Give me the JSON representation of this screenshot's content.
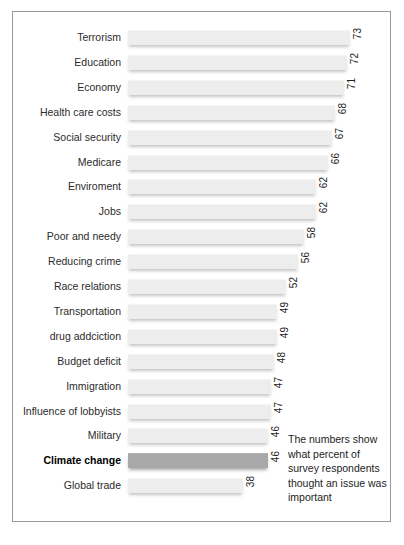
{
  "chart_data": {
    "type": "bar",
    "orientation": "horizontal",
    "title": "",
    "subtitle": "",
    "xlabel": "",
    "ylabel": "",
    "xlim": [
      0,
      80
    ],
    "grid": false,
    "legend": null,
    "annotation": "The numbers show what percent of survey respondents thought an issue was important",
    "highlight_category": "Climate change",
    "categories": [
      "Terrorism",
      "Education",
      "Economy",
      "Health care costs",
      "Social security",
      "Medicare",
      "Enviroment",
      "Jobs",
      "Poor and needy",
      "Reducing crime",
      "Race relations",
      "Transportation",
      "drug addciction",
      "Budget deficit",
      "Immigration",
      "Influence of lobbyists",
      "Military",
      "Climate change",
      "Global trade"
    ],
    "values": [
      73,
      72,
      71,
      68,
      67,
      66,
      62,
      62,
      58,
      56,
      52,
      49,
      49,
      48,
      47,
      47,
      46,
      46,
      38
    ]
  },
  "colors": {
    "bar": "#ededed",
    "bar_highlight": "#a8a8a8",
    "border": "#9a9a9a",
    "text": "#1d1d1d",
    "caption": "#bfbfbf"
  },
  "caption": {
    "source_text": ""
  }
}
